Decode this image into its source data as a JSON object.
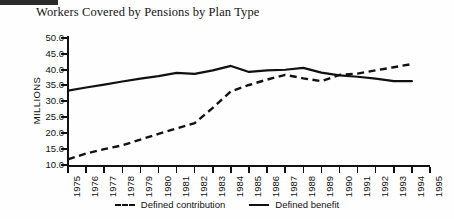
{
  "title": "Workers Covered by Pensions by Plan Type",
  "axis": {
    "y_label": "MILLIONS",
    "y_ticks": [
      "50.0",
      "45.0",
      "40.0",
      "35.0",
      "30.0",
      "25.0",
      "20.0",
      "15.0",
      "10.0"
    ],
    "x_ticks": [
      "1975",
      "1976",
      "1977",
      "1978",
      "1979",
      "1980",
      "1981",
      "1982",
      "1983",
      "1984",
      "1985",
      "1986",
      "1987",
      "1988",
      "1989",
      "1990",
      "1991",
      "1992",
      "1993",
      "1994",
      "1995"
    ]
  },
  "legend": {
    "items": [
      {
        "label": "Defined contribution",
        "style": "dashed"
      },
      {
        "label": "Defined benefit",
        "style": "solid"
      }
    ]
  },
  "colors": {
    "ink": "#111111",
    "background": "#fefefe"
  },
  "chart_data": {
    "type": "line",
    "title": "Workers Covered by Pensions by Plan Type",
    "xlabel": "",
    "ylabel": "MILLIONS",
    "ylim": [
      10.0,
      50.0
    ],
    "ytick_step": 5.0,
    "grid": false,
    "legend_position": "bottom-center",
    "x": [
      1975,
      1976,
      1977,
      1978,
      1979,
      1980,
      1981,
      1982,
      1983,
      1984,
      1985,
      1986,
      1987,
      1988,
      1989,
      1990,
      1991,
      1992,
      1993,
      1994
    ],
    "series": [
      {
        "name": "Defined contribution",
        "style": "dashed",
        "values": [
          11.8,
          13.6,
          15.0,
          16.2,
          18.0,
          19.8,
          21.5,
          23.2,
          28.0,
          33.2,
          35.2,
          36.9,
          38.4,
          37.3,
          36.4,
          38.4,
          38.8,
          39.8,
          40.8,
          41.8
        ]
      },
      {
        "name": "Defined benefit",
        "style": "solid",
        "values": [
          33.4,
          34.4,
          35.3,
          36.3,
          37.2,
          38.0,
          39.0,
          38.7,
          39.8,
          41.2,
          39.3,
          39.8,
          40.0,
          40.6,
          39.1,
          38.2,
          37.8,
          37.2,
          36.4,
          36.4
        ]
      }
    ]
  }
}
